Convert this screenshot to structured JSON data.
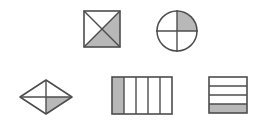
{
  "figure": {
    "background_color": "#ffffff",
    "stroke_color": "#4d4d4d",
    "shade_color": "#b8b8b8",
    "unshaded_color": "#ffffff",
    "stroke_width": 1.4,
    "width": 261,
    "height": 125
  },
  "shapes": [
    {
      "id": "square-diagonals",
      "name": "Square divided by both diagonals",
      "type": "square",
      "partition": "two-diagonals",
      "total_parts": 4,
      "shaded_parts": 2,
      "fraction": "2/4",
      "shaded_regions": [
        "right-triangle",
        "bottom-triangle"
      ],
      "bounds": {
        "x": 84,
        "y": 11,
        "width": 36,
        "height": 36
      }
    },
    {
      "id": "circle-quarters",
      "name": "Circle divided into quarters",
      "type": "circle",
      "partition": "vertical-and-horizontal-diameters",
      "total_parts": 4,
      "shaded_parts": 1,
      "fraction": "1/4",
      "shaded_regions": [
        "top-right-quadrant"
      ],
      "bounds": {
        "x": 157,
        "y": 11,
        "width": 40,
        "height": 40
      }
    },
    {
      "id": "rhombus-quarters",
      "name": "Rhombus divided into quarters",
      "type": "rhombus",
      "partition": "vertical-and-horizontal-diagonals",
      "total_parts": 4,
      "shaded_parts": 1,
      "fraction": "1/4",
      "shaded_regions": [
        "bottom-right-quadrant"
      ],
      "bounds": {
        "x": 20,
        "y": 80,
        "width": 52,
        "height": 34
      }
    },
    {
      "id": "rect-vertical",
      "name": "Rectangle divided into five vertical strips",
      "type": "rectangle",
      "partition": "vertical-strips",
      "total_parts": 5,
      "shaded_parts": 1,
      "fraction": "1/5",
      "shaded_regions": [
        "strip-1"
      ],
      "bounds": {
        "x": 112,
        "y": 77,
        "width": 60,
        "height": 37
      }
    },
    {
      "id": "rect-horizontal",
      "name": "Rectangle divided into four horizontal bands",
      "type": "rectangle",
      "partition": "horizontal-bands",
      "total_parts": 4,
      "shaded_parts": 1,
      "fraction": "1/4",
      "shaded_regions": [
        "band-4"
      ],
      "bounds": {
        "x": 209,
        "y": 77,
        "width": 38,
        "height": 36
      }
    }
  ]
}
